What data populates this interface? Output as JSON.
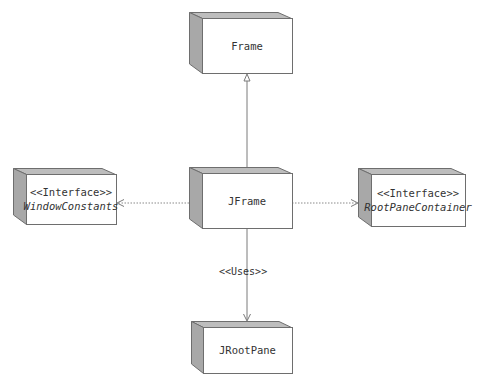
{
  "diagram": {
    "type": "uml-class-dependency",
    "colors": {
      "face_fill": "#ffffff",
      "side_fill": "#a8a8a8",
      "top_fill": "#bdbdbd",
      "border": "#6e6e6e",
      "line": "#7a7a7a",
      "text": "#333333"
    },
    "nodes": [
      {
        "id": "frame",
        "name": "Frame",
        "stereotype": "",
        "italic": false,
        "x": 189,
        "y": 12,
        "face_x": 202,
        "face_y": 18,
        "face_w": 90,
        "face_h": 55
      },
      {
        "id": "jframe",
        "name": "JFrame",
        "stereotype": "",
        "italic": false,
        "x": 189,
        "y": 167,
        "face_x": 202,
        "face_y": 173,
        "face_w": 90,
        "face_h": 55
      },
      {
        "id": "windowconstants",
        "name": "WindowConstants",
        "stereotype": "<<Interface>>",
        "italic": true,
        "x": 13,
        "y": 168,
        "face_x": 26,
        "face_y": 174,
        "face_w": 90,
        "face_h": 50
      },
      {
        "id": "rootpanecontainer",
        "name": "RootPaneContainer",
        "stereotype": "<<Interface>>",
        "italic": true,
        "x": 358,
        "y": 168,
        "face_x": 371,
        "face_y": 174,
        "face_w": 94,
        "face_h": 52
      },
      {
        "id": "jrootpane",
        "name": "JRootPane",
        "stereotype": "",
        "italic": false,
        "x": 191,
        "y": 321,
        "face_x": 203,
        "face_y": 327,
        "face_w": 89,
        "face_h": 46
      }
    ],
    "edges": [
      {
        "id": "jframe-frame",
        "from": "JFrame",
        "to": "Frame",
        "kind": "generalization",
        "style": "solid",
        "label": ""
      },
      {
        "id": "jframe-windowconstants",
        "from": "JFrame",
        "to": "WindowConstants",
        "kind": "realization",
        "style": "dotted",
        "label": ""
      },
      {
        "id": "jframe-rootpanecontainer",
        "from": "JFrame",
        "to": "RootPaneContainer",
        "kind": "realization",
        "style": "dotted",
        "label": ""
      },
      {
        "id": "jframe-jrootpane",
        "from": "JFrame",
        "to": "JRootPane",
        "kind": "dependency",
        "style": "solid",
        "label": "<<Uses>>"
      }
    ]
  }
}
